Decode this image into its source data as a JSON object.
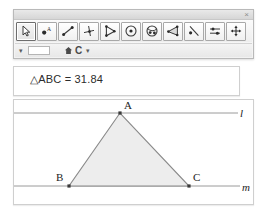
{
  "window": {
    "close_label": "×"
  },
  "toolbar": {
    "tools": [
      {
        "name": "select-arrow-tool",
        "label": "Select Arrow",
        "selected": true
      },
      {
        "name": "point-tool",
        "label": "Point",
        "selected": false
      },
      {
        "name": "segment-tool",
        "label": "Segment",
        "selected": false
      },
      {
        "name": "perpendicular-tool",
        "label": "Perpendicular",
        "selected": false
      },
      {
        "name": "ray-tool",
        "label": "Ray",
        "selected": false
      },
      {
        "name": "circle-tool",
        "label": "Circle",
        "selected": false
      },
      {
        "name": "ellipse-tool",
        "label": "Ellipse",
        "selected": false
      },
      {
        "name": "angle-tool",
        "label": "Angle",
        "selected": false
      },
      {
        "name": "line-point-tool",
        "label": "Line Through Point",
        "selected": false
      },
      {
        "name": "measure-tool",
        "label": "Measure",
        "selected": false
      },
      {
        "name": "move-tool",
        "label": "Move",
        "selected": false
      }
    ]
  },
  "subtoolbar": {
    "dropdown_caret": "▾",
    "field_value": "",
    "home_label": "Home",
    "style_label": "C",
    "style_caret": "▾"
  },
  "measurement": {
    "text": "△ABC = 31.84",
    "value": "31.84",
    "object": "△ABC"
  },
  "canvas": {
    "labels": {
      "point_a": "A",
      "point_b": "B",
      "point_c": "C",
      "line_l": "l",
      "line_m": "m"
    },
    "points": {
      "A": {
        "x": 106,
        "y": 13
      },
      "B": {
        "x": 55,
        "y": 86
      },
      "C": {
        "x": 175,
        "y": 86
      }
    },
    "lines": {
      "l": {
        "x1": 0,
        "y1": 13,
        "x2": 224,
        "y2": 13
      },
      "m": {
        "x1": 0,
        "y1": 86,
        "x2": 226,
        "y2": 86
      }
    },
    "colors": {
      "triangle_fill": "#ededed",
      "triangle_stroke": "#8a8a8a",
      "line_stroke": "#9a9a9a",
      "point_fill": "#3a3a3a"
    }
  }
}
